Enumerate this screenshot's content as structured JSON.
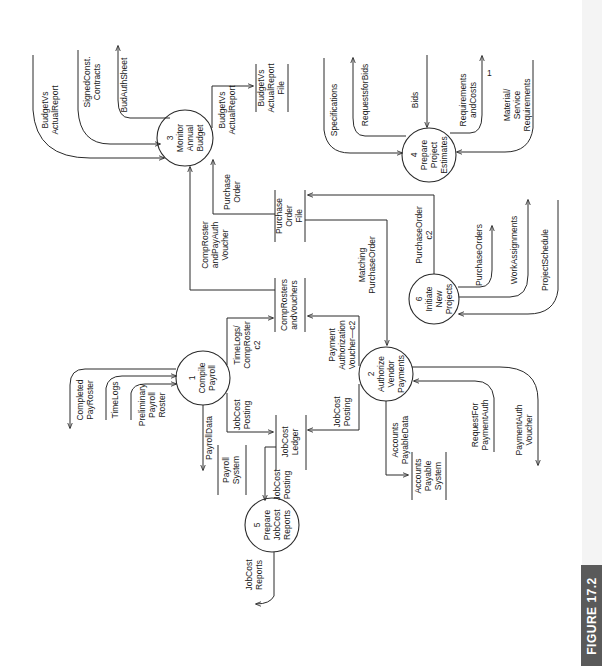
{
  "figure": {
    "label": "FIGURE 17.2"
  },
  "processes": [
    {
      "id": "1",
      "number": "1",
      "lines": [
        "Compile",
        "Payroll"
      ]
    },
    {
      "id": "2",
      "number": "2",
      "lines": [
        "Authorize",
        "Vendor",
        "Payments"
      ]
    },
    {
      "id": "3",
      "number": "3",
      "lines": [
        "Monitor",
        "Annual",
        "Budget"
      ]
    },
    {
      "id": "4",
      "number": "4",
      "lines": [
        "Prepare",
        "Project",
        "Estimates"
      ]
    },
    {
      "id": "5",
      "number": "5",
      "lines": [
        "Prepare",
        "JobCost",
        "Reports"
      ]
    },
    {
      "id": "6",
      "number": "6",
      "lines": [
        "Initiate",
        "New",
        "Projects"
      ]
    }
  ],
  "data_stores": [
    {
      "id": "po_file",
      "lines": [
        "Purchase",
        "Order",
        "File"
      ]
    },
    {
      "id": "comp_rosters",
      "lines": [
        "CompRosters",
        "andVouchers"
      ]
    },
    {
      "id": "jobcost_ledger",
      "lines": [
        "JobCost",
        "Ledger"
      ]
    },
    {
      "id": "payroll_system",
      "lines": [
        "Payroll",
        "System"
      ]
    },
    {
      "id": "ap_system",
      "lines": [
        "Accounts",
        "Payable",
        "System"
      ]
    },
    {
      "id": "bva_file",
      "lines": [
        "BudgetVs",
        "ActualReport",
        "File"
      ]
    }
  ],
  "flows": {
    "budget_vs_actual_in": [
      "BudgetVs",
      "ActualReport"
    ],
    "signed_const_contracts": [
      "SignedConst.",
      "Contracts"
    ],
    "budget_auth_sheet": [
      "BudAuthSheet"
    ],
    "budget_vs_actual_out": [
      "BudgetVs",
      "ActualReport"
    ],
    "purchase_order": [
      "Purchase",
      "Order"
    ],
    "comp_roster_payauth": [
      "CompRoster",
      "andPayAuth",
      "Voucher"
    ],
    "matching_po": [
      "Matching",
      "PurchaseOrder"
    ],
    "purchase_order_c2": [
      "PurchaseOrder",
      "c2"
    ],
    "specifications": [
      "Specifications"
    ],
    "requests_for_bids": [
      "RequestsforBids"
    ],
    "bids": [
      "Bids"
    ],
    "requirements_costs": [
      "Requirements",
      "andCosts"
    ],
    "material_service_req": [
      "Material/",
      "Service",
      "Requirements"
    ],
    "purchase_orders": [
      "PurchaseOrders"
    ],
    "work_assignments": [
      "WorkAssignments"
    ],
    "project_schedule": [
      "ProjectSchedule"
    ],
    "completed_pay_roster": [
      "Completed",
      "PayRoster"
    ],
    "time_logs": [
      "TimeLogs"
    ],
    "preliminary_payroll_roster": [
      "Preliminary",
      "Payroll",
      "Roster"
    ],
    "timelogs_comproster": [
      "TimeLogs/",
      "CompRoster",
      "c2"
    ],
    "jobcost_posting_1": [
      "JobCost",
      "Posting"
    ],
    "payroll_data": [
      "PayrollData"
    ],
    "payment_auth_voucher_c2": [
      "Payment",
      "Authorization",
      "Voucher—c2"
    ],
    "jobcost_posting_2": [
      "JobCost",
      "Posting"
    ],
    "accounts_payable_data": [
      "Accounts",
      "PayableData"
    ],
    "request_for_payment_auth": [
      "RequestFor",
      "PaymentAuth"
    ],
    "payment_auth_voucher": [
      "PaymentAuth",
      "Voucher"
    ],
    "jobcost_posting_5": [
      "JobCost",
      "Posting"
    ],
    "jobcost_reports": [
      "JobCost",
      "Reports"
    ]
  },
  "marks": {
    "tick": "1"
  }
}
